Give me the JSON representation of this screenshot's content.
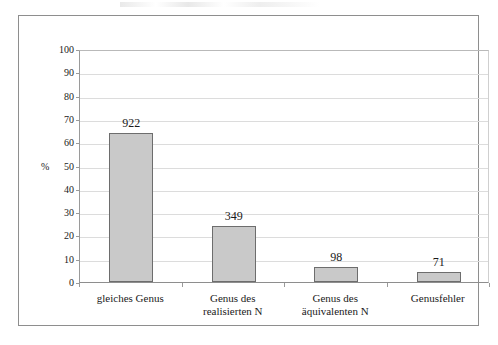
{
  "chart_data": {
    "type": "bar",
    "title": "",
    "subtitle": "",
    "xlabel": "",
    "ylabel": "%",
    "ylim": [
      0,
      100
    ],
    "grid": true,
    "legend": "none",
    "categories": [
      "gleiches Genus",
      "Genus des realisierten N",
      "Genus des äquivalenten N",
      "Genusfehler"
    ],
    "category_lines": [
      [
        "gleiches Genus"
      ],
      [
        "Genus des",
        "realisierten N"
      ],
      [
        "Genus des",
        "äquivalenten N"
      ],
      [
        "Genusfehler"
      ]
    ],
    "values": [
      64,
      24,
      6.5,
      4.5
    ],
    "data_labels": [
      "922",
      "349",
      "98",
      "71"
    ],
    "y_ticks": [
      0,
      10,
      20,
      30,
      40,
      50,
      60,
      70,
      80,
      90,
      100
    ],
    "y_tick_labels": [
      "0",
      "10",
      "20",
      "30",
      "40",
      "50",
      "60",
      "70",
      "80",
      "90",
      "100"
    ],
    "bar_color": "#c9c9c9",
    "bar_edge_color": "#6d6d6d",
    "grid_color": "#dcdcdc",
    "frame_color": "#8e8e8e",
    "text_color": "#1a1a1a"
  }
}
